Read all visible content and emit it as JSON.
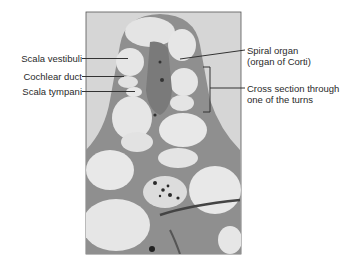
{
  "figure": {
    "labels_left": [
      {
        "text": "Scala vestibuli"
      },
      {
        "text": "Cochlear duct"
      },
      {
        "text": "Scala tympani"
      }
    ],
    "labels_right": [
      {
        "line1": "Spiral organ",
        "line2": "(organ of Corti)"
      },
      {
        "line1": "Cross section through",
        "line2": "one of the turns"
      }
    ]
  },
  "colors": {
    "background": "#ffffff",
    "slide_background": "#d9d9d9",
    "tissue": "#8c8c8c",
    "lumen": "#e6e6e6",
    "label_text": "#2a2a2a",
    "leader_line": "#333333"
  }
}
